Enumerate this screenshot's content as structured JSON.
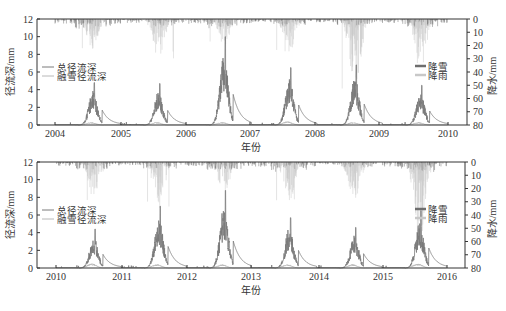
{
  "chart_data": [
    {
      "type": "line",
      "panel": "top",
      "xlabel": "年份",
      "ylabel": "径流深/mm",
      "ylabel_right": "降水/mm",
      "ylim": [
        0,
        12
      ],
      "ylim_right_inverted": [
        0,
        80
      ],
      "yticks": [
        0,
        2,
        4,
        6,
        8,
        10,
        12
      ],
      "yticks_right": [
        0,
        10,
        20,
        30,
        40,
        50,
        60,
        70,
        80
      ],
      "x_ticks": [
        "2004",
        "2005",
        "2006",
        "2007",
        "2008",
        "2009",
        "2010"
      ],
      "legend_left": [
        "总径流深",
        "融雪径流深"
      ],
      "legend_right": [
        "降雪",
        "降雨"
      ],
      "series": [
        {
          "name": "总径流深",
          "annual_peak_mm": [
            4.8,
            4.7,
            10.0,
            6.5,
            6.8,
            4.5
          ]
        },
        {
          "name": "融雪径流深",
          "annual_peak_mm": [
            0.3,
            0.3,
            0.3,
            0.4,
            0.3,
            0.3
          ]
        },
        {
          "name": "降雪",
          "annual_max_mm": [
            15,
            12,
            15,
            10,
            10,
            12
          ]
        },
        {
          "name": "降雨",
          "annual_max_mm": [
            25,
            30,
            20,
            25,
            55,
            35
          ]
        }
      ],
      "years": [
        2004,
        2005,
        2006,
        2007,
        2008,
        2009
      ]
    },
    {
      "type": "line",
      "panel": "bottom",
      "xlabel": "年份",
      "ylabel": "径流深/mm",
      "ylabel_right": "降水/mm",
      "ylim": [
        0,
        12
      ],
      "ylim_right_inverted": [
        0,
        80
      ],
      "yticks": [
        0,
        2,
        4,
        6,
        8,
        10,
        12
      ],
      "yticks_right": [
        0,
        10,
        20,
        30,
        40,
        50,
        60,
        70,
        80
      ],
      "x_ticks": [
        "2010",
        "2011",
        "2012",
        "2013",
        "2014",
        "2015",
        "2016"
      ],
      "legend_left": [
        "总径流深",
        "融雪径流深"
      ],
      "legend_right": [
        "降雪",
        "降雨"
      ],
      "series": [
        {
          "name": "总径流深",
          "annual_peak_mm": [
            4.4,
            7.0,
            8.8,
            5.7,
            4.6,
            6.5
          ]
        },
        {
          "name": "融雪径流深",
          "annual_peak_mm": [
            0.5,
            0.4,
            0.4,
            0.4,
            0.4,
            0.5
          ]
        },
        {
          "name": "降雪",
          "annual_max_mm": [
            12,
            10,
            12,
            15,
            8,
            15
          ]
        },
        {
          "name": "降雨",
          "annual_max_mm": [
            30,
            35,
            25,
            30,
            30,
            60
          ]
        }
      ],
      "years": [
        2010,
        2011,
        2012,
        2013,
        2014,
        2015
      ]
    }
  ],
  "colors": {
    "total_runoff": "#7a7a7a",
    "snowmelt_runoff": "#b8b8b8",
    "snowfall": "#6e6e6e",
    "rainfall": "#c8c8c8",
    "axis": "#333333"
  }
}
